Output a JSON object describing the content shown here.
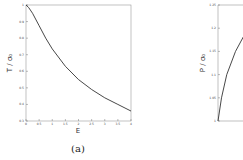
{
  "chart_data": [
    {
      "type": "line",
      "panel_label": "(a)",
      "xlabel": "E",
      "ylabel": "T / σ₀",
      "xlim": [
        0,
        4
      ],
      "ylim": [
        0.3,
        1
      ],
      "x_ticks": [
        "0",
        "0.5",
        "1",
        "1.5",
        "2",
        "2.5",
        "3",
        "3.5",
        "4"
      ],
      "y_ticks": [
        "0.3",
        "0.4",
        "0.5",
        "0.6",
        "0.7",
        "0.8",
        "0.9",
        "1"
      ],
      "grid": false,
      "series": [
        {
          "name": "T/σ0",
          "x": [
            0,
            0.1,
            0.25,
            0.5,
            0.75,
            1,
            1.5,
            2,
            2.5,
            3,
            3.5,
            4
          ],
          "y": [
            1.0,
            0.985,
            0.95,
            0.875,
            0.8,
            0.735,
            0.63,
            0.55,
            0.49,
            0.44,
            0.4,
            0.36
          ]
        }
      ]
    },
    {
      "type": "line",
      "panel_label": "",
      "xlabel": "",
      "ylabel": "P / σ₀",
      "ylim": [
        1,
        1.25
      ],
      "y_ticks": [
        "1",
        "1.05",
        "1.1",
        "1.15",
        "1.2",
        "1.25"
      ],
      "grid": false,
      "series": [
        {
          "name": "P/σ0",
          "x": [
            0,
            0.1,
            0.25,
            0.5,
            0.75,
            1
          ],
          "y": [
            1.0,
            1.05,
            1.1,
            1.15,
            1.185,
            1.2
          ]
        }
      ]
    }
  ]
}
